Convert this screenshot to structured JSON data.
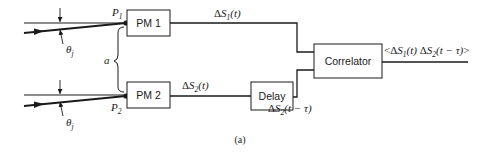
{
  "diagram": {
    "type": "block-diagram",
    "caption": "(a)",
    "inputs": [
      {
        "id": "p1",
        "point_label": "P",
        "point_sub": "1",
        "angle_label": "θ",
        "angle_sub": "j"
      },
      {
        "id": "p2",
        "point_label": "P",
        "point_sub": "2",
        "angle_label": "θ",
        "angle_sub": "j"
      }
    ],
    "separation_label": "a",
    "blocks": {
      "pm1": "PM 1",
      "pm2": "PM 2",
      "delay": "Delay",
      "correlator": "Correlator"
    },
    "signals": {
      "s1": {
        "delta": "Δ",
        "var": "S",
        "sub": "1",
        "arg": "(t)"
      },
      "s2": {
        "delta": "Δ",
        "var": "S",
        "sub": "2",
        "arg": "(t)"
      },
      "s2_delayed": {
        "delta": "Δ",
        "var": "S",
        "sub": "2",
        "arg": "(t − τ)"
      },
      "output": {
        "open": "<",
        "d1": "Δ",
        "v1": "S",
        "sub1": "1",
        "arg1": "(t)",
        "d2": " Δ",
        "v2": "S",
        "sub2": "2",
        "arg2": "(t − τ)",
        "close": ">"
      }
    },
    "colors": {
      "ink": "#1a1a1a",
      "background": "#ffffff"
    }
  }
}
